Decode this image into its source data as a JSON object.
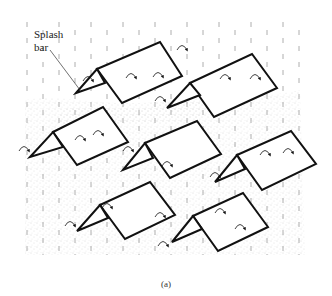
{
  "figure": {
    "label_line1": "Splash",
    "label_line2": "bar",
    "caption": "(a)",
    "colors": {
      "stroke": "#111111",
      "rain": "#9a9a9a",
      "stipple": "#b5b5b5",
      "background": "#ffffff"
    },
    "bars": [
      {
        "name": "splash-bar-1",
        "apex": [
          76,
          93
        ],
        "ridge_front": [
          97,
          69
        ],
        "ridge_back": [
          160,
          42
        ],
        "corner_back": [
          182,
          76
        ],
        "bottom_front": [
          122,
          103
        ],
        "inner": [
          105,
          83
        ]
      },
      {
        "name": "splash-bar-2",
        "apex": [
          167,
          108
        ],
        "ridge_front": [
          190,
          83
        ],
        "ridge_back": [
          252,
          54
        ],
        "corner_back": [
          277,
          88
        ],
        "bottom_front": [
          214,
          117
        ],
        "inner": [
          200,
          95
        ]
      },
      {
        "name": "splash-bar-3",
        "apex": [
          30,
          157
        ],
        "ridge_front": [
          53,
          132
        ],
        "ridge_back": [
          103,
          107
        ],
        "corner_back": [
          128,
          142
        ],
        "bottom_front": [
          77,
          165
        ],
        "inner": [
          63,
          147
        ]
      },
      {
        "name": "splash-bar-4",
        "apex": [
          123,
          170
        ],
        "ridge_front": [
          145,
          143
        ],
        "ridge_back": [
          197,
          121
        ],
        "corner_back": [
          221,
          154
        ],
        "bottom_front": [
          170,
          178
        ],
        "inner": [
          153,
          158
        ]
      },
      {
        "name": "splash-bar-5",
        "apex": [
          215,
          182
        ],
        "ridge_front": [
          237,
          155
        ],
        "ridge_back": [
          291,
          131
        ],
        "corner_back": [
          316,
          164
        ],
        "bottom_front": [
          262,
          190
        ],
        "inner": [
          245,
          169
        ]
      },
      {
        "name": "splash-bar-6",
        "apex": [
          77,
          231
        ],
        "ridge_front": [
          100,
          205
        ],
        "ridge_back": [
          150,
          182
        ],
        "corner_back": [
          175,
          215
        ],
        "bottom_front": [
          125,
          239
        ],
        "inner": [
          108,
          218
        ]
      },
      {
        "name": "splash-bar-7",
        "apex": [
          172,
          242
        ],
        "ridge_front": [
          193,
          216
        ],
        "ridge_back": [
          243,
          193
        ],
        "corner_back": [
          268,
          227
        ],
        "bottom_front": [
          218,
          251
        ],
        "inner": [
          202,
          229
        ]
      }
    ],
    "splash_arrows": [
      [
        88,
        78
      ],
      [
        131,
        75
      ],
      [
        158,
        74
      ],
      [
        182,
        47
      ],
      [
        225,
        76
      ],
      [
        255,
        76
      ],
      [
        160,
        98
      ],
      [
        24,
        148
      ],
      [
        80,
        137
      ],
      [
        98,
        132
      ],
      [
        128,
        148
      ],
      [
        167,
        163
      ],
      [
        215,
        174
      ],
      [
        265,
        152
      ],
      [
        288,
        150
      ],
      [
        70,
        223
      ],
      [
        107,
        205
      ],
      [
        160,
        214
      ],
      [
        163,
        243
      ],
      [
        220,
        210
      ],
      [
        240,
        226
      ]
    ],
    "leader_line": {
      "from": [
        50,
        50
      ],
      "to": [
        80,
        90
      ]
    }
  }
}
